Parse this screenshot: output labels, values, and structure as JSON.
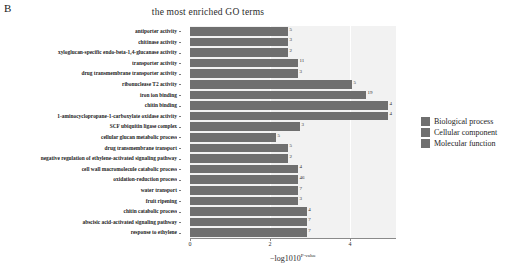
{
  "panel_letter": "B",
  "legend": {
    "items": [
      {
        "label": "Biological process",
        "color": "#6f6f6f"
      },
      {
        "label": "Cellular component",
        "color": "#6f6f6f"
      },
      {
        "label": "Molecular function",
        "color": "#6f6f6f"
      }
    ]
  },
  "chart_data": {
    "type": "bar",
    "orientation": "horizontal",
    "title": "the most enriched GO terms",
    "xlabel": "−log10",
    "xlabel_sup": "P-value",
    "ylabel": "GO terms",
    "xlim": [
      0,
      5.15
    ],
    "xticks": [
      0,
      2,
      4
    ],
    "xticklabels": [
      "0",
      "2",
      "4"
    ],
    "grid": true,
    "bar_color": "#6f6f6f",
    "plot_background": "#f2f2f2",
    "categories": [
      "antiporter activity",
      "chitinase activity",
      "xyloglucan-specific endo-beta-1,4-glucanase activity",
      "transporter activity",
      "drug transmembrane transporter activity",
      "ribonuclease T2 activity",
      "iron ion binding",
      "chitin binding",
      "1-aminocyclopropane-1-carboxylate oxidase activity",
      "SCF ubiquitin ligase complex",
      "cellular glucan metabolic process",
      "drug transmembrane transport",
      "negative regulation of ethylene-activated signaling pathway",
      "cell wall macromolecule catabolic process",
      "oxidation-reduction process",
      "water transport",
      "fruit ripening",
      "chitin catabolic process",
      "abscisic acid-activated signaling pathway",
      "response to ethylene"
    ],
    "values": [
      2.45,
      2.45,
      2.45,
      2.7,
      2.7,
      4.05,
      4.4,
      4.95,
      4.95,
      2.75,
      2.15,
      2.45,
      2.45,
      2.7,
      2.7,
      2.7,
      2.7,
      2.92,
      2.92,
      2.92
    ],
    "gene_counts": [
      "5",
      "3",
      "2",
      "11",
      "3",
      "5",
      "19",
      "4",
      "4",
      "3",
      "5",
      "5",
      "2",
      "4",
      "46",
      "7",
      "3",
      "4",
      "7",
      "7"
    ],
    "series_groups": [
      "Molecular function",
      "Molecular function",
      "Molecular function",
      "Molecular function",
      "Molecular function",
      "Molecular function",
      "Molecular function",
      "Molecular function",
      "Molecular function",
      "Cellular component",
      "Biological process",
      "Biological process",
      "Biological process",
      "Biological process",
      "Biological process",
      "Biological process",
      "Biological process",
      "Biological process",
      "Biological process",
      "Biological process"
    ]
  }
}
